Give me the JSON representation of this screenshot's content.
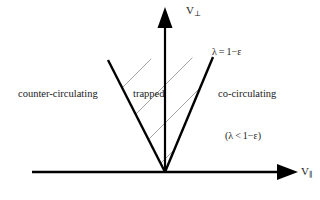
{
  "figure": {
    "type": "phase-space-diagram",
    "background_color": "#ffffff",
    "line_color": "#000000",
    "hatch_color": "#8d8d8d",
    "axes": {
      "vertical": {
        "name": "v-perpendicular-axis",
        "label_symbol": "V",
        "label_subscript": "⊥",
        "label_full": "V⊥",
        "origin": {
          "x": 165,
          "y": 172
        },
        "tip": {
          "x": 165,
          "y": 8
        },
        "arrow": "up"
      },
      "horizontal": {
        "name": "v-parallel-axis",
        "label_symbol": "V",
        "label_subscript": "∥",
        "label_full": "V∥",
        "origin": {
          "x": 32,
          "y": 172
        },
        "tip": {
          "x": 297,
          "y": 172
        },
        "arrow": "right"
      }
    },
    "separatrix": {
      "name": "trapped-region-boundary",
      "apex": {
        "x": 165,
        "y": 172
      },
      "left_arm_end": {
        "x": 108,
        "y": 60
      },
      "right_arm_end": {
        "x": 213,
        "y": 57
      },
      "stroke_width": 2.4
    },
    "hatching": {
      "name": "trapped-region-hatching",
      "direction": "lower-left-to-upper-right",
      "line_count": 7,
      "stroke_width": 0.8
    },
    "regions": [
      {
        "id": "counter",
        "label": "counter-circulating",
        "x": 18,
        "y": 89
      },
      {
        "id": "trapped",
        "label": "trapped",
        "x": 133,
        "y": 89
      },
      {
        "id": "co",
        "label": "co-circulating",
        "x": 218,
        "y": 89
      }
    ],
    "annotations": {
      "lambda_equation": "λ = 1−ε",
      "lambda_inequality": "(λ < 1−ε)"
    }
  }
}
